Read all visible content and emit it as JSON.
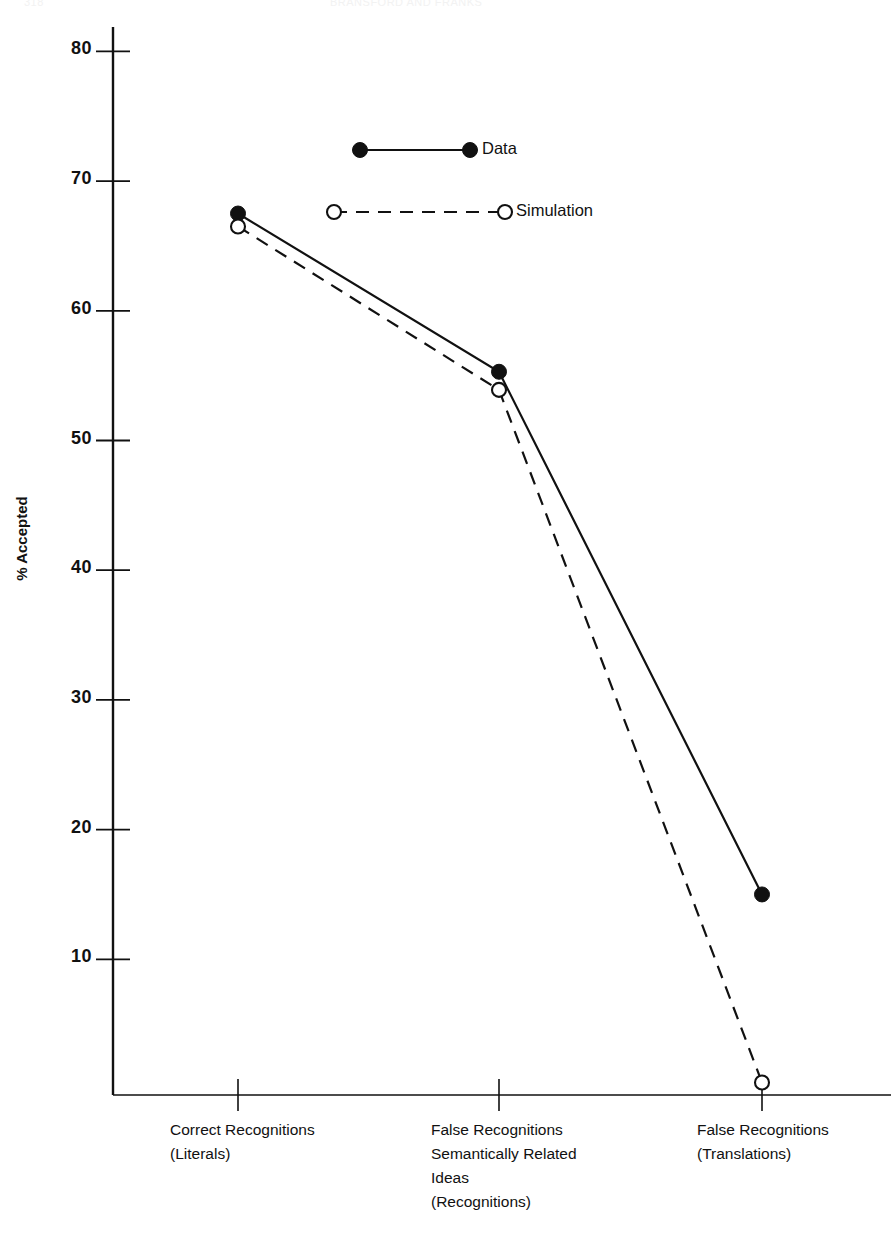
{
  "figure": {
    "header_fragment_left": "318",
    "header_fragment_center": "BRANSFORD AND FRANKS",
    "width": 891,
    "height": 1246,
    "background": "#ffffff",
    "ink_color": "#111111"
  },
  "chart_data": {
    "type": "line",
    "title": "",
    "subtitle": "",
    "xlabel": "",
    "ylabel": "% Accepted",
    "categories": [
      "Correct Recognitions\n(Literals)",
      "False Recognitions\nSemantically Related\nIdeas\n(Recognitions)",
      "False Recognitions\n(Translations)"
    ],
    "category_lines": [
      [
        "Correct Recognitions",
        "(Literals)"
      ],
      [
        "False Recognitions",
        "Semantically Related",
        "Ideas",
        "(Recognitions)"
      ],
      [
        "False Recognitions",
        "(Translations)"
      ]
    ],
    "series": [
      {
        "name": "Data",
        "values": [
          67.5,
          55.3,
          15.0
        ],
        "line_style": "solid",
        "marker": "filled-circle",
        "color": "#111111"
      },
      {
        "name": "Simulation",
        "values": [
          66.5,
          53.9,
          0.5
        ],
        "line_style": "dashed",
        "marker": "open-circle",
        "color": "#111111"
      }
    ],
    "ylim": [
      0,
      85
    ],
    "yticks": [
      10,
      20,
      30,
      40,
      50,
      60,
      70,
      80
    ],
    "ytick_labels": [
      "10",
      "20",
      "30",
      "40",
      "50",
      "60",
      "70",
      "80"
    ],
    "grid": false,
    "legend_position": "upper-center",
    "legend_entries": [
      "Data",
      "Simulation"
    ]
  }
}
